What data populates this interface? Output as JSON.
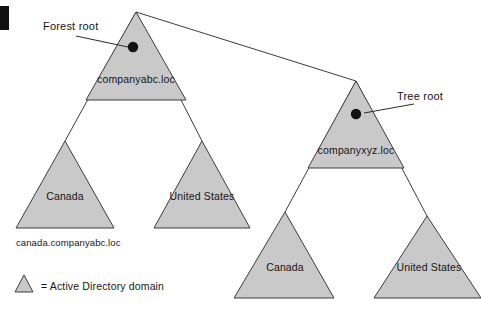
{
  "figure": {
    "corner_mark": "black-corner-block",
    "background_color": "#ffffff",
    "domain_fill_color": "#c9c9c9",
    "domain_stroke_color": "#3d3d3d",
    "root_dot_color": "#121212"
  },
  "callouts": {
    "forest_root": "Forest root",
    "tree_root": "Tree root"
  },
  "domains": {
    "companyabc": "companyabc.loc",
    "companyabc_canada": "Canada",
    "companyabc_us": "United States",
    "companyxyz": "companyxyz.loc",
    "companyxyz_canada": "Canada",
    "companyxyz_us": "United States"
  },
  "captions": {
    "canada_fqdn": "canada.companyabc.loc"
  },
  "legend": {
    "label": "= Active Directory domain"
  }
}
